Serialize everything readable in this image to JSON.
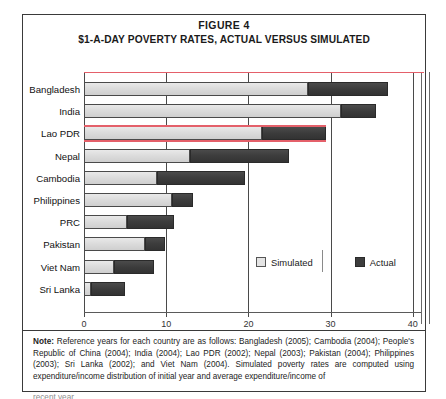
{
  "figure": {
    "number": "FIGURE 4",
    "title": "$1-A-DAY POVERTY RATES, ACTUAL VERSUS SIMULATED"
  },
  "legend": {
    "simulated_label": "Simulated",
    "actual_label": "Actual"
  },
  "note": {
    "label": "Note:",
    "body": " Reference years for each country are as follows: Bangladesh (2005); Cambodia (2004); People's Republic of China (2004); India (2004); Lao PDR (2002); Nepal (2003); Pakistan (2004); Philippines (2003); Sri Lanka (2002); and Viet Nam (2004). Simulated poverty rates are computed using expenditure/income distribution of initial year and average expenditure/income of",
    "cut_off_line": "recent year."
  },
  "colors": {
    "simulated": "#dcdcdc",
    "actual": "#3c3c3c",
    "annotation_red": "#e4606a",
    "frame": "#3a3a3a"
  },
  "chart_data": {
    "type": "bar",
    "orientation": "horizontal",
    "title": "$1-A-DAY POVERTY RATES, ACTUAL VERSUS SIMULATED",
    "xlabel": "",
    "ylabel": "",
    "xlim": [
      0,
      41
    ],
    "xticks": [
      0,
      10,
      20,
      30,
      40
    ],
    "xtick_labels": [
      "0",
      "10",
      "20",
      "30",
      "40"
    ],
    "grid": "vertical",
    "legend_position": "inside-right",
    "categories": [
      "Bangladesh",
      "India",
      "Lao PDR",
      "Nepal",
      "Cambodia",
      "Philippines",
      "PRC",
      "Pakistan",
      "Viet Nam",
      "Sri Lanka"
    ],
    "series": [
      {
        "name": "Simulated",
        "color": "#dcdcdc",
        "values": [
          27.2,
          31.3,
          21.7,
          12.9,
          8.9,
          10.7,
          5.2,
          7.4,
          3.7,
          0.8
        ]
      },
      {
        "name": "Actual",
        "color": "#3c3c3c",
        "values": [
          37.0,
          35.5,
          29.5,
          25.0,
          19.6,
          13.2,
          11.0,
          9.8,
          8.5,
          5.0
        ]
      }
    ],
    "note": "Each bar is drawn as an overlay: the light Simulated segment starts at 0 and the dark Actual segment extends from the Simulated value to the Actual value."
  }
}
